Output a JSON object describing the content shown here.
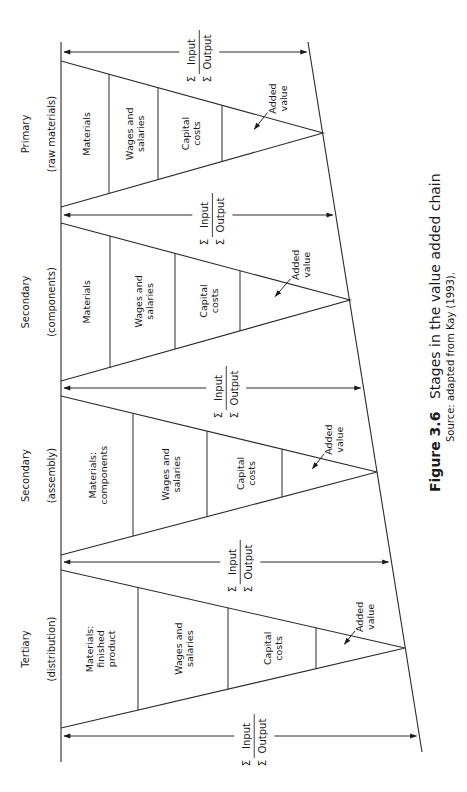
{
  "caption": {
    "figure_number": "Figure 3.6",
    "title": "Stages in the value added chain",
    "source": "Source: adapted from Kay (1993)."
  },
  "flow_label": {
    "numerator": "Input",
    "denominator": "Output",
    "sigma": "Σ"
  },
  "stages": [
    {
      "name": "Primary",
      "qualifier": "(raw materials)",
      "segments": [
        "Materials",
        "Wages and|salaries",
        "Capital|costs"
      ],
      "added_value": "Added|value"
    },
    {
      "name": "Secondary",
      "qualifier": "(components)",
      "segments": [
        "Materials",
        "Wages and|salaries",
        "Capital|costs"
      ],
      "added_value": "Added|value"
    },
    {
      "name": "Secondary",
      "qualifier": "(assembly)",
      "segments": [
        "Materials:|components",
        "Wages and|salaries",
        "Capital|costs"
      ],
      "added_value": "Added|value"
    },
    {
      "name": "Tertiary",
      "qualifier": "(distribution)",
      "segments": [
        "Materials:|finished|product",
        "Wages and|salaries",
        "Capital|costs"
      ],
      "added_value": "Added|value"
    }
  ],
  "geometry": {
    "baseline_x": 61,
    "baseline_y": [
      42,
      762
    ],
    "slant_top": [
      308,
      42
    ],
    "slant_bottom": [
      422,
      752
    ],
    "arrows_y": [
      52,
      215,
      388,
      562,
      736
    ],
    "triangles": [
      {
        "top": 61,
        "bottom": 207,
        "apex": [
          323,
          133
        ],
        "dividers": [
          109,
          158,
          222
        ]
      },
      {
        "top": 223,
        "bottom": 381,
        "apex": [
          350,
          300
        ],
        "dividers": [
          110,
          175,
          240
        ]
      },
      {
        "top": 396,
        "bottom": 555,
        "apex": [
          377,
          472
        ],
        "dividers": [
          133,
          207,
          282
        ]
      },
      {
        "top": 570,
        "bottom": 728,
        "apex": [
          405,
          648
        ],
        "dividers": [
          138,
          228,
          316
        ]
      }
    ]
  },
  "colors": {
    "line": "#2a2a2a",
    "text": "#1a1a1a",
    "background": "#ffffff"
  }
}
